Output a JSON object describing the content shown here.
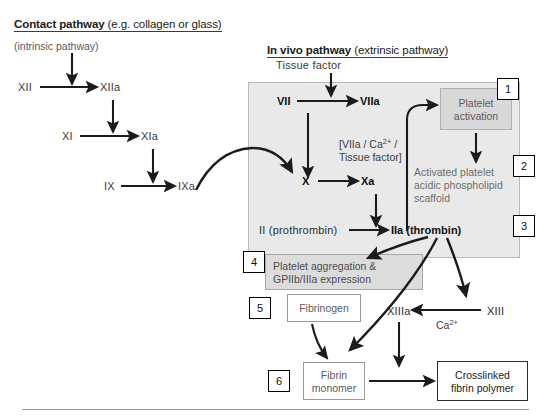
{
  "diagram": {
    "colors": {
      "shade_large": "#e9e9e9",
      "shade_box": "#d8d8d8",
      "arrow": "#1b1b1b",
      "grey_text": "#5c5c5c",
      "dark_text": "#111111"
    }
  },
  "headers": {
    "contact": {
      "bold": "Contact pathway",
      "regular": " (e.g. collagen or glass)",
      "sub": "(intrinsic pathway)"
    },
    "invivo": {
      "bold": "In vivo pathway",
      "regular": " (extrinsic pathway)",
      "sub": "Tissue factor"
    }
  },
  "intrinsic": {
    "nodes": [
      {
        "id": "XII",
        "label": "XII"
      },
      {
        "id": "XIIa",
        "label": "XIIa"
      },
      {
        "id": "XI",
        "label": "XI"
      },
      {
        "id": "XIa",
        "label": "XIa"
      },
      {
        "id": "IX",
        "label": "IX"
      },
      {
        "id": "IXa",
        "label": "IXa"
      }
    ]
  },
  "extrinsic": {
    "nodes": [
      {
        "id": "VII",
        "label": "VII"
      },
      {
        "id": "VIIa",
        "label": "VIIa"
      },
      {
        "id": "X",
        "label": "X"
      },
      {
        "id": "Xa",
        "label": "Xa"
      },
      {
        "id": "II",
        "label": "II (prothrombin)"
      },
      {
        "id": "IIa",
        "label": "IIa (thrombin)"
      },
      {
        "id": "XIII",
        "label": "XIII"
      },
      {
        "id": "XIIIa",
        "label": "XIIIa"
      }
    ],
    "complex_line1": "[VIIa / Ca",
    "complex_sup": "2+",
    "complex_line1_end": " /",
    "complex_line2": "Tissue factor]",
    "calcium": "Ca",
    "calcium_sup": "2+"
  },
  "boxes": {
    "platelet_activation": "Platelet\nactivation",
    "scaffold": "Activated platelet\nacidic phospholipid\nscaffold",
    "platelet_aggregation": "Platelet aggregation &\nGPIIb/IIIa expression",
    "fibrinogen": "Fibrinogen",
    "fibrin_monomer": "Fibrin\nmonomer",
    "crosslinked": "Crosslinked\nfibrin polymer"
  },
  "callouts": [
    {
      "n": "1"
    },
    {
      "n": "2"
    },
    {
      "n": "3"
    },
    {
      "n": "4"
    },
    {
      "n": "5"
    },
    {
      "n": "6"
    }
  ]
}
